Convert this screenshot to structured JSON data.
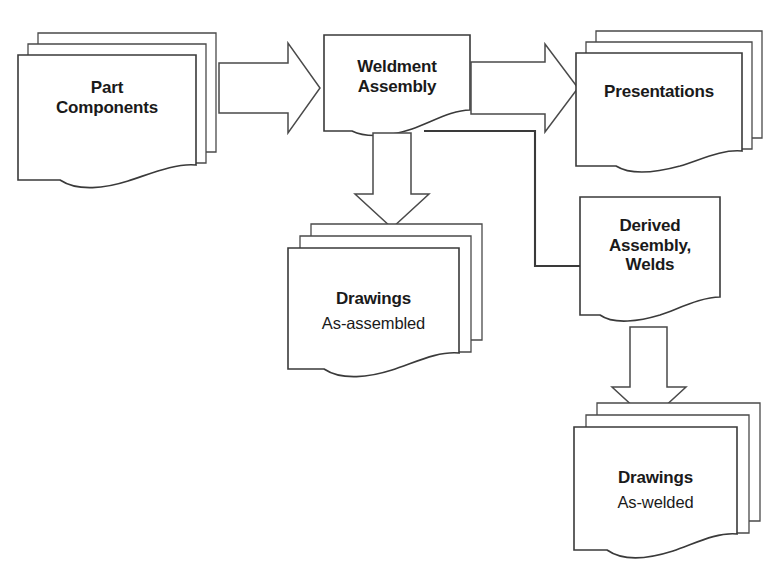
{
  "diagram": {
    "background_color": "#ffffff",
    "line_color": "#3a3a3a",
    "text_color": "#1a1a1a",
    "nodes": [
      {
        "id": "part-components",
        "primary": "Part",
        "secondary": "Components",
        "shape": "document-stack",
        "stack_count": 3,
        "bold_secondary": true
      },
      {
        "id": "weldment-assembly",
        "primary": "Weldment",
        "secondary": "Assembly",
        "shape": "document",
        "stack_count": 1,
        "bold_secondary": true
      },
      {
        "id": "presentations",
        "primary": "Presentations",
        "secondary": "",
        "shape": "document-stack",
        "stack_count": 3,
        "bold_secondary": false
      },
      {
        "id": "drawings-as-assembled",
        "primary": "Drawings",
        "secondary": "As-assembled",
        "shape": "document-stack",
        "stack_count": 3,
        "bold_secondary": false
      },
      {
        "id": "derived-assembly-welds",
        "primary": "Derived",
        "secondary": "Assembly,",
        "tertiary": "Welds",
        "shape": "document",
        "stack_count": 1,
        "bold_secondary": true
      },
      {
        "id": "drawings-as-welded",
        "primary": "Drawings",
        "secondary": "As-welded",
        "shape": "document-stack",
        "stack_count": 3,
        "bold_secondary": false
      }
    ],
    "connectors": [
      {
        "id": "part-to-weldment",
        "type": "block-arrow",
        "direction": "right",
        "from": "part-components",
        "to": "weldment-assembly"
      },
      {
        "id": "weldment-to-presentations",
        "type": "block-arrow",
        "direction": "right",
        "from": "weldment-assembly",
        "to": "presentations"
      },
      {
        "id": "weldment-to-drawings-assembled",
        "type": "block-arrow",
        "direction": "down",
        "from": "weldment-assembly",
        "to": "drawings-as-assembled"
      },
      {
        "id": "weldment-to-derived",
        "type": "plain-line",
        "direction": "right-down-right",
        "from": "weldment-assembly",
        "to": "derived-assembly-welds"
      },
      {
        "id": "derived-to-drawings-welded",
        "type": "block-arrow",
        "direction": "down",
        "from": "derived-assembly-welds",
        "to": "drawings-as-welded"
      }
    ]
  }
}
